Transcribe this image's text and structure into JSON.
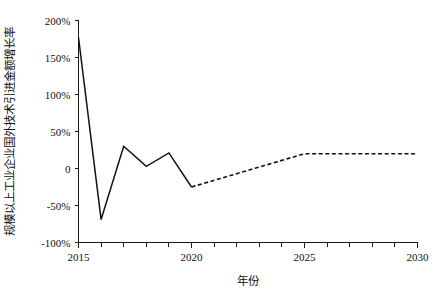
{
  "chart_data": {
    "type": "line",
    "title": "",
    "xlabel": "年份",
    "ylabel": "规模以上工业企业国外技术引进金额增长率",
    "x": [
      2015,
      2016,
      2017,
      2018,
      2019,
      2020,
      2021,
      2022,
      2023,
      2024,
      2025,
      2026,
      2027,
      2028,
      2029,
      2030
    ],
    "xlim": [
      2015,
      2030
    ],
    "ylim": [
      -100,
      200
    ],
    "grid": false,
    "legend_position": "none",
    "xtick_labels": [
      "2015",
      "2020",
      "2025",
      "2030"
    ],
    "xtick_values": [
      2015,
      2020,
      2025,
      2030
    ],
    "xtick_minor_step": 1,
    "ytick_labels": [
      "200%",
      "150%",
      "100%",
      "50%",
      "0",
      "-50%",
      "-100%"
    ],
    "ytick_values": [
      200,
      150,
      100,
      50,
      0,
      -50,
      -100
    ],
    "series": [
      {
        "name": "历史值",
        "style": "solid",
        "color": "#111111",
        "x": [
          2015,
          2016,
          2017,
          2018,
          2019,
          2020
        ],
        "values": [
          177,
          -69,
          30,
          3,
          21,
          -25
        ]
      },
      {
        "name": "预测值",
        "style": "dashed",
        "color": "#111111",
        "x": [
          2020,
          2025,
          2030
        ],
        "values": [
          -25,
          20,
          20
        ]
      }
    ]
  }
}
